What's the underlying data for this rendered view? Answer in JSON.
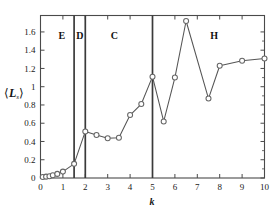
{
  "chart_data": {
    "type": "line",
    "title": "",
    "xlabel": "k",
    "ylabel": "⟨L_s⟩",
    "xlim": [
      0,
      10
    ],
    "ylim": [
      0,
      1.78
    ],
    "grid": false,
    "legend": "none",
    "marker": "open-circle",
    "line_color": "#555555",
    "marker_color": "#666666",
    "x": [
      0.1,
      0.25,
      0.4,
      0.55,
      0.75,
      1.0,
      1.5,
      2.0,
      2.5,
      3.0,
      3.5,
      4.0,
      4.5,
      5.0,
      5.5,
      6.0,
      6.5,
      7.5,
      8.0,
      9.0,
      10.0
    ],
    "values": [
      0.01,
      0.015,
      0.02,
      0.03,
      0.045,
      0.07,
      0.155,
      0.51,
      0.47,
      0.435,
      0.44,
      0.69,
      0.81,
      1.11,
      0.62,
      1.1,
      1.72,
      0.87,
      1.23,
      1.285,
      1.31
    ],
    "xticks": [
      0,
      1,
      2,
      3,
      4,
      5,
      6,
      7,
      8,
      9,
      10
    ],
    "xticklabels": [
      "0",
      "1",
      "2",
      "3",
      "4",
      "5",
      "6",
      "7",
      "8",
      "9",
      "10"
    ],
    "yticks": [
      0,
      0.2,
      0.4,
      0.6,
      0.8,
      1.0,
      1.2,
      1.4,
      1.6
    ],
    "yticklabels": [
      "0",
      "0.2",
      "0.4",
      "0.6",
      "0.8",
      "1",
      "1.2",
      "1.4",
      "1.6"
    ],
    "dividers": [
      {
        "x": 1.5,
        "color": "#3a3a3a"
      },
      {
        "x": 2.0,
        "color": "#3a3a3a"
      },
      {
        "x": 5.0,
        "color": "#3a3a3a"
      }
    ],
    "annotations": [
      {
        "label": "E",
        "x": 0.95,
        "y": 1.52
      },
      {
        "label": "D",
        "x": 1.76,
        "y": 1.52
      },
      {
        "label": "C",
        "x": 3.3,
        "y": 1.52
      },
      {
        "label": "H",
        "x": 7.75,
        "y": 1.52
      }
    ]
  }
}
